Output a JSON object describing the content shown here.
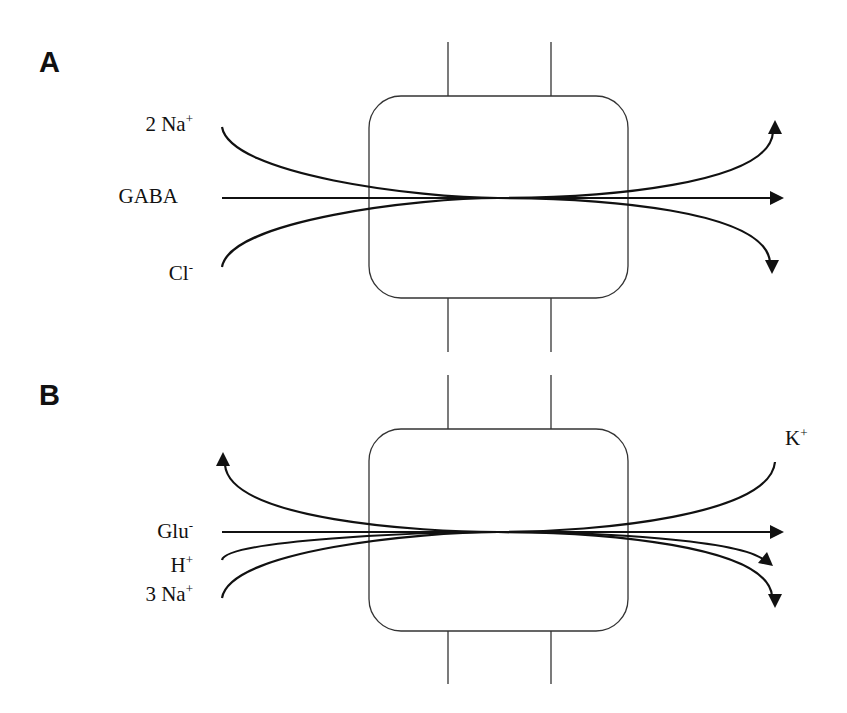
{
  "panels": [
    {
      "id": "A",
      "label": "A",
      "transporter": "GABA transporter",
      "ions": {
        "na": {
          "coef": "2 Na",
          "charge": "+"
        },
        "gaba": {
          "text": "GABA"
        },
        "cl": {
          "text": "Cl",
          "charge": "-"
        }
      },
      "flows": [
        {
          "species": "2 Na+",
          "direction": "in-to-out",
          "arrow": "up-right"
        },
        {
          "species": "GABA",
          "direction": "in-to-out",
          "arrow": "right"
        },
        {
          "species": "Cl-",
          "direction": "in-to-out",
          "arrow": "down-right"
        }
      ]
    },
    {
      "id": "B",
      "label": "B",
      "transporter": "Glutamate transporter",
      "ions": {
        "k": {
          "text": "K",
          "charge": "+"
        },
        "glu": {
          "text": "Glu",
          "charge": "-"
        },
        "h": {
          "text": "H",
          "charge": "+"
        },
        "na": {
          "coef": "3 Na",
          "charge": "+"
        }
      },
      "flows": [
        {
          "species": "K+",
          "direction": "right-to-left",
          "arrow": "up-left"
        },
        {
          "species": "Glu-",
          "direction": "left-to-right",
          "arrow": "right"
        },
        {
          "species": "H+",
          "direction": "left-to-right",
          "arrow": "down-right"
        },
        {
          "species": "3 Na+",
          "direction": "left-to-right",
          "arrow": "down-right"
        }
      ]
    }
  ],
  "colors": {
    "line": "#111111",
    "membrane": "#333333",
    "background": "#ffffff"
  }
}
